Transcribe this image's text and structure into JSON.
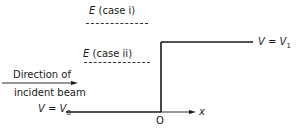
{
  "diagram": {
    "energy_levels": [
      {
        "symbol": "E",
        "label": "(case i)"
      },
      {
        "symbol": "E",
        "label": "(case ii)"
      }
    ],
    "potential_high": {
      "lhs": "V",
      "eq": " = ",
      "rhs": "V",
      "sub": "1"
    },
    "potential_low": {
      "lhs": "V",
      "eq": " = ",
      "rhs": "V",
      "sub": "0"
    },
    "direction_label": {
      "line1": "Direction of",
      "line2": "incident beam"
    },
    "origin_label": "O",
    "axis_label": "x",
    "colors": {
      "line": "#1a1a1a",
      "background": "#ffffff"
    }
  }
}
